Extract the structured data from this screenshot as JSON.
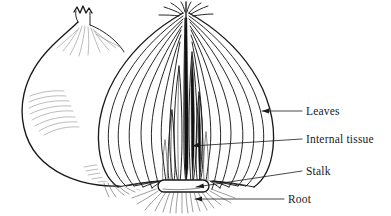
{
  "figure": {
    "background_color": "#ffffff",
    "ink_color": "#1a1a1a",
    "subjects": [
      {
        "name": "whole-onion",
        "description": "intact onion bulb with dry papery skin, neck and wispy root hairs"
      },
      {
        "name": "cut-onion",
        "description": "longitudinally sectioned onion bulb showing concentric fleshy leaves, internal tissue, basal stalk plate and roots"
      }
    ]
  },
  "labels": [
    {
      "id": "leaves",
      "text": "Leaves",
      "x": 306,
      "y": 115,
      "leader": {
        "from_x": 302,
        "from_y": 111,
        "to_x": 262,
        "to_y": 111,
        "arrow": true
      }
    },
    {
      "id": "internal-tissue",
      "text": "Internal tissue",
      "x": 306,
      "y": 143,
      "leader": {
        "from_x": 302,
        "from_y": 139,
        "to_x": 192,
        "to_y": 146,
        "arrow": true
      }
    },
    {
      "id": "stalk",
      "text": "Stalk",
      "x": 306,
      "y": 175,
      "leader": {
        "from_x": 302,
        "from_y": 171,
        "to_x": 196,
        "to_y": 187,
        "arrow": true
      }
    },
    {
      "id": "root",
      "text": "Root",
      "x": 288,
      "y": 203,
      "leader": {
        "from_x": 284,
        "from_y": 199,
        "to_x": 195,
        "to_y": 199,
        "arrow": true
      }
    }
  ]
}
